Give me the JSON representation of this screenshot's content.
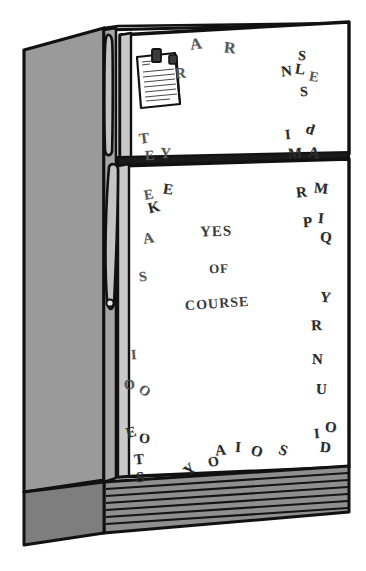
{
  "scene": {
    "title": "Refrigerator with magnetic letters",
    "colors": {
      "outline": "#111111",
      "body_side": "#9a9a9a",
      "door_face": "#ffffff",
      "grille": "#8f8f8f",
      "letter_dark": "#2b2b2b",
      "letter_mid": "#4a4a4a",
      "letter_light": "#6d6d6d",
      "background": "#ffffff"
    }
  },
  "fridge": {
    "freezer_door_label": "freezer-door",
    "main_door_label": "main-door",
    "handle_label": "door-handle",
    "grille_label": "bottom-grille",
    "side_panel_label": "left-side-panel"
  },
  "note": {
    "label": "shopping-list-note",
    "magnet_label": "note-magnet-clip",
    "line_count": 9
  },
  "message": {
    "lines": [
      {
        "text": "YES",
        "x": 200,
        "y": 223,
        "size": 15,
        "rot": -2
      },
      {
        "text": "OF",
        "x": 209,
        "y": 261,
        "size": 13,
        "rot": -2
      },
      {
        "text": "COURSE",
        "x": 185,
        "y": 296,
        "size": 14,
        "rot": -4
      }
    ]
  },
  "magnet_letters": [
    {
      "ch": "A",
      "x": 190,
      "y": 36,
      "size": 16,
      "rot": -8,
      "tone": "mid"
    },
    {
      "ch": "R",
      "x": 224,
      "y": 40,
      "size": 16,
      "rot": 6,
      "tone": "mid"
    },
    {
      "ch": "R",
      "x": 175,
      "y": 66,
      "size": 15,
      "rot": -4,
      "tone": "mid"
    },
    {
      "ch": "S",
      "x": 298,
      "y": 49,
      "size": 14,
      "rot": 4,
      "tone": "dark"
    },
    {
      "ch": "N",
      "x": 281,
      "y": 64,
      "size": 15,
      "rot": -6,
      "tone": "dark"
    },
    {
      "ch": "L",
      "x": 295,
      "y": 62,
      "size": 15,
      "rot": 8,
      "tone": "dark"
    },
    {
      "ch": "E",
      "x": 309,
      "y": 70,
      "size": 14,
      "rot": 10,
      "tone": "mid"
    },
    {
      "ch": "S",
      "x": 300,
      "y": 85,
      "size": 14,
      "rot": -4,
      "tone": "dark"
    },
    {
      "ch": "I",
      "x": 285,
      "y": 128,
      "size": 14,
      "rot": -6,
      "tone": "dark"
    },
    {
      "ch": "d",
      "x": 306,
      "y": 122,
      "size": 15,
      "rot": 18,
      "tone": "dark"
    },
    {
      "ch": "M",
      "x": 288,
      "y": 146,
      "size": 15,
      "rot": -4,
      "tone": "dark"
    },
    {
      "ch": "A",
      "x": 308,
      "y": 145,
      "size": 16,
      "rot": 6,
      "tone": "dark"
    },
    {
      "ch": "T",
      "x": 139,
      "y": 131,
      "size": 15,
      "rot": -8,
      "tone": "mid"
    },
    {
      "ch": "E",
      "x": 145,
      "y": 149,
      "size": 14,
      "rot": -4,
      "tone": "mid"
    },
    {
      "ch": "Y",
      "x": 160,
      "y": 146,
      "size": 15,
      "rot": 4,
      "tone": "mid"
    },
    {
      "ch": "E",
      "x": 144,
      "y": 188,
      "size": 14,
      "rot": -10,
      "tone": "mid"
    },
    {
      "ch": "E",
      "x": 163,
      "y": 182,
      "size": 15,
      "rot": 8,
      "tone": "dark"
    },
    {
      "ch": "K",
      "x": 148,
      "y": 200,
      "size": 15,
      "rot": -14,
      "tone": "dark"
    },
    {
      "ch": "A",
      "x": 143,
      "y": 231,
      "size": 15,
      "rot": -10,
      "tone": "mid"
    },
    {
      "ch": "S",
      "x": 139,
      "y": 270,
      "size": 14,
      "rot": -8,
      "tone": "mid"
    },
    {
      "ch": "R",
      "x": 296,
      "y": 185,
      "size": 15,
      "rot": -6,
      "tone": "dark"
    },
    {
      "ch": "M",
      "x": 314,
      "y": 181,
      "size": 15,
      "rot": 6,
      "tone": "dark"
    },
    {
      "ch": "P",
      "x": 303,
      "y": 215,
      "size": 15,
      "rot": -4,
      "tone": "dark"
    },
    {
      "ch": "I",
      "x": 318,
      "y": 211,
      "size": 15,
      "rot": 6,
      "tone": "dark"
    },
    {
      "ch": "Q",
      "x": 320,
      "y": 230,
      "size": 15,
      "rot": 4,
      "tone": "dark"
    },
    {
      "ch": "Y",
      "x": 320,
      "y": 290,
      "size": 15,
      "rot": 6,
      "tone": "dark"
    },
    {
      "ch": "R",
      "x": 311,
      "y": 318,
      "size": 15,
      "rot": -2,
      "tone": "dark"
    },
    {
      "ch": "N",
      "x": 312,
      "y": 352,
      "size": 15,
      "rot": 2,
      "tone": "dark"
    },
    {
      "ch": "U",
      "x": 316,
      "y": 382,
      "size": 15,
      "rot": 2,
      "tone": "dark"
    },
    {
      "ch": "I",
      "x": 314,
      "y": 427,
      "size": 14,
      "rot": -6,
      "tone": "dark"
    },
    {
      "ch": "O",
      "x": 325,
      "y": 420,
      "size": 15,
      "rot": 6,
      "tone": "dark"
    },
    {
      "ch": "D",
      "x": 320,
      "y": 440,
      "size": 15,
      "rot": 6,
      "tone": "dark"
    },
    {
      "ch": "S",
      "x": 279,
      "y": 443,
      "size": 15,
      "rot": 20,
      "tone": "dark"
    },
    {
      "ch": "O",
      "x": 251,
      "y": 444,
      "size": 15,
      "rot": 14,
      "tone": "dark"
    },
    {
      "ch": "I",
      "x": 235,
      "y": 440,
      "size": 15,
      "rot": 4,
      "tone": "dark"
    },
    {
      "ch": "A",
      "x": 215,
      "y": 443,
      "size": 15,
      "rot": -6,
      "tone": "dark"
    },
    {
      "ch": "O",
      "x": 208,
      "y": 455,
      "size": 14,
      "rot": -10,
      "tone": "dark"
    },
    {
      "ch": "Y",
      "x": 184,
      "y": 462,
      "size": 15,
      "rot": -42,
      "tone": "dark"
    },
    {
      "ch": "I",
      "x": 131,
      "y": 348,
      "size": 14,
      "rot": -4,
      "tone": "mid"
    },
    {
      "ch": "O",
      "x": 124,
      "y": 378,
      "size": 14,
      "rot": -8,
      "tone": "mid"
    },
    {
      "ch": "O",
      "x": 139,
      "y": 384,
      "size": 14,
      "rot": 34,
      "tone": "mid"
    },
    {
      "ch": "E",
      "x": 126,
      "y": 425,
      "size": 15,
      "rot": -14,
      "tone": "dark"
    },
    {
      "ch": "O",
      "x": 139,
      "y": 432,
      "size": 14,
      "rot": 4,
      "tone": "dark"
    },
    {
      "ch": "T",
      "x": 134,
      "y": 452,
      "size": 15,
      "rot": -6,
      "tone": "dark"
    },
    {
      "ch": "S",
      "x": 136,
      "y": 470,
      "size": 15,
      "rot": -4,
      "tone": "dark"
    }
  ]
}
